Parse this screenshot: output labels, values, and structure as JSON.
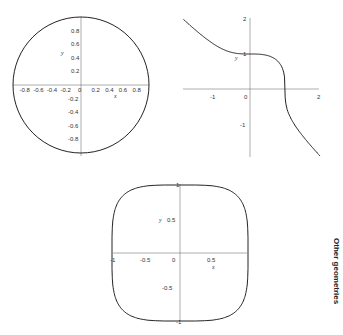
{
  "side_label": "Other geometries",
  "chart_data": [
    {
      "type": "line",
      "title": "",
      "curve": "unit circle x^2 + y^2 = 1",
      "xlabel": "x",
      "ylabel": "y",
      "xlim": [
        -1,
        1
      ],
      "ylim": [
        -1,
        1
      ],
      "x_ticks": [
        "-0.8",
        "-0.6",
        "-0.4",
        "-0.2",
        "0",
        "0.2",
        "0.4",
        "0.6",
        "0.8"
      ],
      "y_ticks": [
        "0.8",
        "0.6",
        "0.4",
        "0.2",
        "-0.2",
        "-0.4",
        "-0.6",
        "-0.8"
      ],
      "grid": false
    },
    {
      "type": "line",
      "title": "",
      "curve": "x^3 + y^3 = 1",
      "xlabel": "",
      "ylabel": "y",
      "xlim": [
        -1.9,
        2
      ],
      "ylim": [
        -1.9,
        2
      ],
      "x_ticks": [
        "-1",
        "0",
        "2"
      ],
      "y_ticks": [
        "2",
        "1",
        "-1"
      ],
      "points": [
        [
          -1.9,
          2.1
        ],
        [
          -1,
          1.26
        ],
        [
          -0.5,
          1.04
        ],
        [
          0,
          1
        ],
        [
          0.5,
          0.96
        ],
        [
          0.9,
          0.65
        ],
        [
          1,
          0
        ],
        [
          1.1,
          -0.7
        ],
        [
          1.5,
          -1.3
        ],
        [
          2,
          -1.91
        ]
      ],
      "grid": false
    },
    {
      "type": "line",
      "title": "",
      "curve": "superellipse x^4 + y^4 = 1",
      "xlabel": "x",
      "ylabel": "y",
      "xlim": [
        -1,
        1
      ],
      "ylim": [
        -1,
        1
      ],
      "x_ticks": [
        "-1",
        "-0.5",
        "0",
        "0.5"
      ],
      "y_ticks": [
        "1",
        "0.5",
        "-0.5",
        "-1"
      ],
      "grid": false
    }
  ]
}
